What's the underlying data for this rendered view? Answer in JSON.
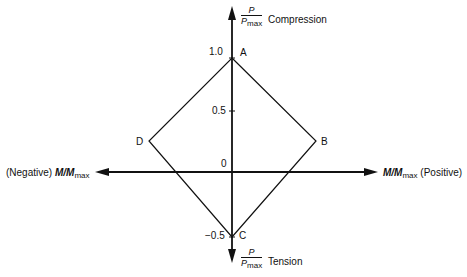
{
  "diagram": {
    "type": "interaction-diagram",
    "vertical_axis": {
      "top_label": {
        "numerator": "P",
        "denominator": "P",
        "denominator_sub": "max",
        "suffix": "Compression"
      },
      "bottom_label": {
        "numerator": "P",
        "denominator": "P",
        "denominator_sub": "max",
        "suffix": "Tension"
      },
      "ticks": [
        {
          "label": "1.0",
          "value": 1.0
        },
        {
          "label": "0.5",
          "value": 0.5
        },
        {
          "label": "0",
          "value": 0
        },
        {
          "label": "−0.5",
          "value": -0.5
        }
      ]
    },
    "horizontal_axis": {
      "left_label": {
        "prefix": "(Negative)",
        "var": "M/M",
        "sub": "max"
      },
      "right_label": {
        "var": "M/M",
        "sub": "max",
        "suffix": "(Positive)"
      }
    },
    "points": [
      {
        "name": "A",
        "label": "A"
      },
      {
        "name": "B",
        "label": "B"
      },
      {
        "name": "C",
        "label": "C"
      },
      {
        "name": "D",
        "label": "D"
      }
    ],
    "colors": {
      "line": "#111111",
      "background": "#ffffff"
    }
  }
}
